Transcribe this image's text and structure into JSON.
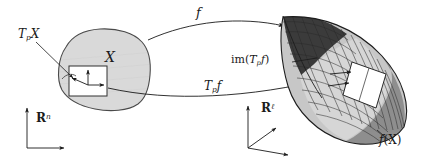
{
  "figure": {
    "width": 435,
    "height": 162,
    "background": "#ffffff",
    "ink": "#1a1a1a"
  },
  "labels": {
    "tangent_space_source": "T",
    "tangent_space_source_sub": "p",
    "tangent_space_source_tail": "X",
    "domain": "X",
    "map": "f",
    "differential": "T",
    "differential_sub": "p",
    "differential_tail": "f",
    "image_of_differential_prefix": "im(",
    "image_of_differential_T": "T",
    "image_of_differential_sub": "p",
    "image_of_differential_f": "f",
    "image_of_differential_suffix": ")",
    "image_of_domain_f": "f",
    "image_of_domain_arg": "(X)",
    "ambient_source": "R",
    "ambient_source_sup": "n",
    "ambient_target": "R",
    "ambient_target_sup": "ℓ"
  },
  "shapes": {
    "domain_blob": {
      "name": "X",
      "fill": "#d8d8d8",
      "stroke": "#4a4a4a",
      "description": "irregular rounded gray blob representing the manifold X"
    },
    "tangent_square": {
      "name": "T_pX",
      "fill": "#ffffff",
      "stroke": "#303030",
      "description": "white square inside blob with two basis arrows and one tangent vector"
    },
    "surface_mesh": {
      "name": "f(X)",
      "fill_light": "#d0d0d0",
      "fill_mid": "#9a9a9a",
      "fill_dark": "#3a3a3a",
      "stroke": "#2a2a2a",
      "description": "curved quadrilateral mesh surface, shaded dark at upper-left fold"
    },
    "tangent_plane_patch": {
      "name": "im(T_pf)",
      "fill": "#ffffff",
      "stroke": "#303030",
      "description": "white parallelogram patch on surface showing image of the tangent space"
    }
  },
  "arrows": {
    "map_arrow": {
      "label": "f",
      "from": "domain blob",
      "to": "surface mesh",
      "style": "long curved arc, upper path"
    },
    "differential_arrow": {
      "label": "T_p f",
      "from": "tangent square",
      "to": "tangent plane patch",
      "style": "long curved arc, lower path"
    },
    "tpx_pointer": {
      "label": "T_p X",
      "style": "straight leader line with arrowhead into the tangent square"
    },
    "imtpf_pointer": {
      "label": "im(T_p f)",
      "style": "short leader line to the tangent plane patch"
    },
    "fx_pointer": {
      "label": "f(X)",
      "style": "short leader line to the surface edge"
    }
  },
  "axes": {
    "source_frame": {
      "label": "R^n",
      "directions": [
        "up",
        "right"
      ],
      "description": "2D coordinate frame for the source space"
    },
    "target_frame": {
      "label": "R^ℓ",
      "directions": [
        "up",
        "diagonal-up-right",
        "right"
      ],
      "description": "3D coordinate frame for the target space"
    }
  }
}
